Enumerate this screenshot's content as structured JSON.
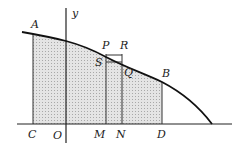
{
  "diagram": {
    "axis_label_y": "y",
    "points": {
      "A": "A",
      "B": "B",
      "P": "P",
      "R": "R",
      "S": "S",
      "Q": "Q",
      "C": "C",
      "O": "O",
      "M": "M",
      "N": "N",
      "D": "D"
    },
    "colors": {
      "stroke": "#222222",
      "shade": "#d6d6d6"
    }
  }
}
